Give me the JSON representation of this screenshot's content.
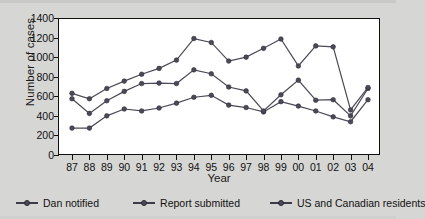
{
  "chart_data": {
    "type": "line",
    "title": "",
    "xlabel": "Year",
    "ylabel": "Number of cases",
    "categories": [
      "87",
      "88",
      "89",
      "90",
      "91",
      "92",
      "93",
      "94",
      "95",
      "96",
      "97",
      "98",
      "99",
      "00",
      "01",
      "02",
      "03",
      "04"
    ],
    "ylim": [
      0,
      1400
    ],
    "yticks": [
      0,
      200,
      400,
      600,
      800,
      1000,
      1200,
      1400
    ],
    "grid": false,
    "legend_position": "bottom",
    "series": [
      {
        "name": "Dan notified",
        "color": "#4a4a58",
        "values": [
          275,
          275,
          400,
          470,
          450,
          480,
          530,
          590,
          610,
          510,
          485,
          440,
          545,
          500,
          450,
          390,
          340,
          565
        ]
      },
      {
        "name": "Report submitted",
        "color": "#4a4a58",
        "values": [
          575,
          425,
          555,
          650,
          730,
          735,
          730,
          870,
          830,
          695,
          655,
          450,
          615,
          765,
          560,
          565,
          400,
          680
        ]
      },
      {
        "name": "US and Canadian residents",
        "color": "#4a4a58",
        "values": [
          630,
          575,
          680,
          755,
          825,
          885,
          970,
          1190,
          1150,
          960,
          1000,
          1090,
          1185,
          910,
          1115,
          1105,
          460,
          690
        ]
      }
    ]
  },
  "axis": {
    "y_label": "Number of cases",
    "x_label": "Year",
    "y_tick_labels": [
      "1400",
      "1200",
      "1000",
      "800",
      "600",
      "400",
      "200",
      "0"
    ],
    "x_tick_labels": [
      "87",
      "88",
      "89",
      "90",
      "91",
      "92",
      "93",
      "94",
      "95",
      "96",
      "97",
      "98",
      "99",
      "00",
      "01",
      "02",
      "03",
      "04"
    ]
  },
  "legend": {
    "items": [
      {
        "label": "Dan notified"
      },
      {
        "label": "Report submitted"
      },
      {
        "label": "US and Canadian residents"
      }
    ]
  },
  "colors": {
    "background": "#d6d6d4",
    "plot_background": "#ffffff",
    "axis": "#111111",
    "series": "#4a4a58"
  }
}
